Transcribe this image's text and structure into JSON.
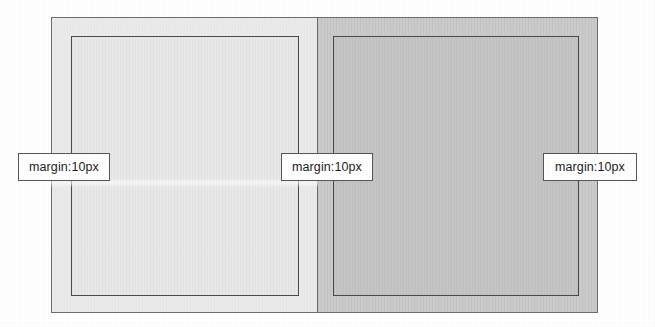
{
  "figure": {
    "title_ghost": "margin and padding",
    "width": 655,
    "height": 327,
    "background": "#ffffff"
  },
  "boxes": {
    "left": {
      "margin_box_name": "margin-area",
      "margin_fill": "#ececec",
      "element_box_name": "element-area",
      "element_fill": "#e8e8e8",
      "border_color": "#6e6e6e"
    },
    "right": {
      "margin_box_name": "margin-area",
      "margin_fill": "#cbcbcb",
      "element_box_name": "element-area",
      "element_fill": "#c6c6c6",
      "border_color": "#6e6e6e"
    }
  },
  "callouts": [
    {
      "id": "left",
      "label": "margin:10px"
    },
    {
      "id": "middle",
      "label": "margin:10px"
    },
    {
      "id": "right",
      "label": "margin:10px"
    }
  ]
}
